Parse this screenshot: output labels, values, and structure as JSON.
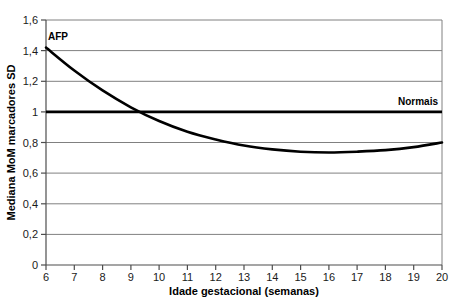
{
  "chart_data": {
    "type": "line",
    "title": "",
    "xlabel": "Idade gestacional (semanas)",
    "ylabel": "Mediana MoM marcadores SD",
    "xlim": [
      6,
      20
    ],
    "ylim": [
      0,
      1.6
    ],
    "grid": true,
    "grid_axis": "y",
    "legend": "inline-annotations",
    "xticks": [
      "6",
      "7",
      "8",
      "9",
      "10",
      "11",
      "12",
      "13",
      "14",
      "15",
      "16",
      "17",
      "18",
      "19",
      "20"
    ],
    "xtick_values": [
      6,
      7,
      8,
      9,
      10,
      11,
      12,
      13,
      14,
      15,
      16,
      17,
      18,
      19,
      20
    ],
    "yticks": [
      "0",
      "0,2",
      "0,4",
      "0,6",
      "0,8",
      "1",
      "1,2",
      "1,4",
      "1,6"
    ],
    "ytick_values": [
      0,
      0.2,
      0.4,
      0.6,
      0.8,
      1.0,
      1.2,
      1.4,
      1.6
    ],
    "series": [
      {
        "name": "AFP",
        "label": "AFP",
        "color": "#000000",
        "x": [
          6,
          7,
          8,
          9,
          10,
          11,
          12,
          13,
          14,
          15,
          16,
          17,
          18,
          19,
          20
        ],
        "values": [
          1.42,
          1.27,
          1.14,
          1.03,
          0.94,
          0.87,
          0.82,
          0.78,
          0.755,
          0.74,
          0.735,
          0.74,
          0.75,
          0.77,
          0.8
        ]
      },
      {
        "name": "Normais",
        "label": "Normais",
        "color": "#000000",
        "x": [
          6,
          20
        ],
        "values": [
          1.0,
          1.0
        ]
      }
    ],
    "annotations": [
      {
        "text": "AFP",
        "x": 6.1,
        "y": 1.5
      },
      {
        "text": "Normais",
        "x": 18.5,
        "y": 1.06
      }
    ]
  }
}
